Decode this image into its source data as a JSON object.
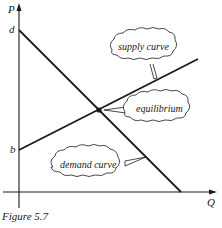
{
  "figure": {
    "caption": "Figure 5.7",
    "axes": {
      "y_label": "P",
      "x_label": "Q"
    },
    "intercepts": {
      "demand_p_intercept": "d",
      "supply_p_intercept": "b"
    },
    "callouts": {
      "supply": "supply curve",
      "equilibrium": "equilibrium",
      "demand": "demand curve"
    },
    "colors": {
      "ink": "#1a1a1a",
      "background": "#ffffff"
    }
  }
}
